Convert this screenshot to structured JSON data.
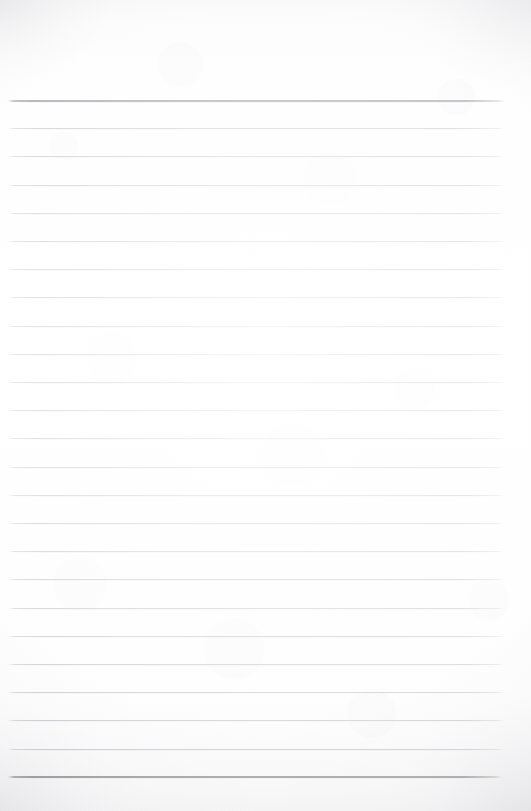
{
  "document": {
    "kind": "lined-writing-paper",
    "title": "Blank lined paper",
    "page_width": 531,
    "page_height": 811,
    "text_content": "",
    "has_handwriting": false,
    "has_printed_text": false
  },
  "colors": {
    "paper_background": "#fcfcfc",
    "paper_shadow_edge": "#e8e8ec",
    "rule_light": "#acacb3",
    "rule_dark": "#606068"
  },
  "ruling": {
    "line_count": 25,
    "first_line_y": 100,
    "last_line_y": 776,
    "line_spacing": 28.2,
    "left_margin_x": 8,
    "right_edge_x": 505,
    "emphasized_line_indices": [
      0,
      24
    ],
    "has_vertical_margin_rule": false,
    "lines": [
      {
        "index": 0,
        "y": 100,
        "weight": "dark",
        "x_start": 8,
        "x_end": 505
      },
      {
        "index": 1,
        "y": 128.2,
        "weight": "light",
        "x_start": 8,
        "x_end": 505
      },
      {
        "index": 2,
        "y": 156.4,
        "weight": "light",
        "x_start": 8,
        "x_end": 505
      },
      {
        "index": 3,
        "y": 184.6,
        "weight": "light",
        "x_start": 8,
        "x_end": 505
      },
      {
        "index": 4,
        "y": 212.8,
        "weight": "light",
        "x_start": 8,
        "x_end": 505
      },
      {
        "index": 5,
        "y": 241.0,
        "weight": "light",
        "x_start": 8,
        "x_end": 505
      },
      {
        "index": 6,
        "y": 269.2,
        "weight": "light",
        "x_start": 8,
        "x_end": 505
      },
      {
        "index": 7,
        "y": 297.4,
        "weight": "light",
        "x_start": 8,
        "x_end": 505
      },
      {
        "index": 8,
        "y": 325.6,
        "weight": "light",
        "x_start": 8,
        "x_end": 505
      },
      {
        "index": 9,
        "y": 353.8,
        "weight": "light",
        "x_start": 8,
        "x_end": 505
      },
      {
        "index": 10,
        "y": 382.0,
        "weight": "light",
        "x_start": 8,
        "x_end": 505
      },
      {
        "index": 11,
        "y": 410.2,
        "weight": "light",
        "x_start": 8,
        "x_end": 505
      },
      {
        "index": 12,
        "y": 438.4,
        "weight": "light",
        "x_start": 8,
        "x_end": 505
      },
      {
        "index": 13,
        "y": 466.6,
        "weight": "light",
        "x_start": 8,
        "x_end": 505
      },
      {
        "index": 14,
        "y": 494.8,
        "weight": "light",
        "x_start": 8,
        "x_end": 505
      },
      {
        "index": 15,
        "y": 523.0,
        "weight": "light",
        "x_start": 8,
        "x_end": 505
      },
      {
        "index": 16,
        "y": 551.2,
        "weight": "light",
        "x_start": 8,
        "x_end": 505
      },
      {
        "index": 17,
        "y": 579.4,
        "weight": "light",
        "x_start": 8,
        "x_end": 505
      },
      {
        "index": 18,
        "y": 607.6,
        "weight": "light",
        "x_start": 8,
        "x_end": 505
      },
      {
        "index": 19,
        "y": 635.8,
        "weight": "light",
        "x_start": 8,
        "x_end": 505
      },
      {
        "index": 20,
        "y": 664.0,
        "weight": "light",
        "x_start": 8,
        "x_end": 505
      },
      {
        "index": 21,
        "y": 692.2,
        "weight": "light",
        "x_start": 8,
        "x_end": 505
      },
      {
        "index": 22,
        "y": 720.4,
        "weight": "light",
        "x_start": 8,
        "x_end": 505
      },
      {
        "index": 23,
        "y": 748.6,
        "weight": "light",
        "x_start": 8,
        "x_end": 504
      },
      {
        "index": 24,
        "y": 776.0,
        "weight": "dark",
        "x_start": 8,
        "x_end": 502
      }
    ]
  }
}
